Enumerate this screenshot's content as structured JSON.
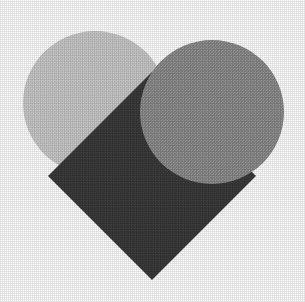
{
  "figure": {
    "background_color": "#ffffff",
    "width": 305,
    "height": 302,
    "texture": "halftone-dither",
    "shapes": [
      {
        "id": "left-lobe",
        "name": "left-circle",
        "type": "circle",
        "label": "Left heart lobe",
        "color": "#c8c8c8",
        "tone": "light gray",
        "cx": 95,
        "cy": 103,
        "r": 72,
        "z": 1
      },
      {
        "id": "body",
        "name": "rotated-square",
        "type": "square",
        "label": "Heart body (square rotated 45 degrees)",
        "color": "#3a3a3a",
        "tone": "dark charcoal",
        "cx": 152,
        "cy": 176,
        "half_diagonal": 104,
        "rotation_deg": 45,
        "vertices": [
          [
            152,
            72
          ],
          [
            256,
            176
          ],
          [
            152,
            280
          ],
          [
            48,
            176
          ]
        ],
        "z": 2
      },
      {
        "id": "right-lobe",
        "name": "right-circle",
        "type": "circle",
        "label": "Right heart lobe",
        "color": "#8c8c8c",
        "tone": "medium gray",
        "cx": 212,
        "cy": 112,
        "r": 72,
        "z": 3
      }
    ],
    "notch": {
      "name": "top-center-notch",
      "label": "White cleft between the two lobes",
      "color": "#ffffff",
      "apex_x": 152,
      "apex_y": 62
    },
    "apex": {
      "name": "bottom-point",
      "label": "Bottom point of the heart",
      "x": 152,
      "y": 280
    }
  }
}
